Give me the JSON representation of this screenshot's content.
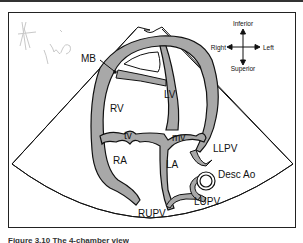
{
  "figure": {
    "caption": "Figure 3.10 The 4-chamber view",
    "handwriting": "imp",
    "orientation": {
      "top": "Inferior",
      "bottom": "Superior",
      "left": "Right",
      "right": "Left"
    },
    "labels": {
      "mb": "MB",
      "rv": "RV",
      "lv": "LV",
      "tv": "tv",
      "mv": "mv",
      "ra": "RA",
      "la": "LA",
      "llpv": "LLPV",
      "desc_ao": "Desc Ao",
      "lupv": "LUPV",
      "rupv": "RUPV"
    },
    "colors": {
      "wall_fill": "#a8a8a8",
      "outline": "#111111",
      "background": "#ffffff"
    }
  }
}
